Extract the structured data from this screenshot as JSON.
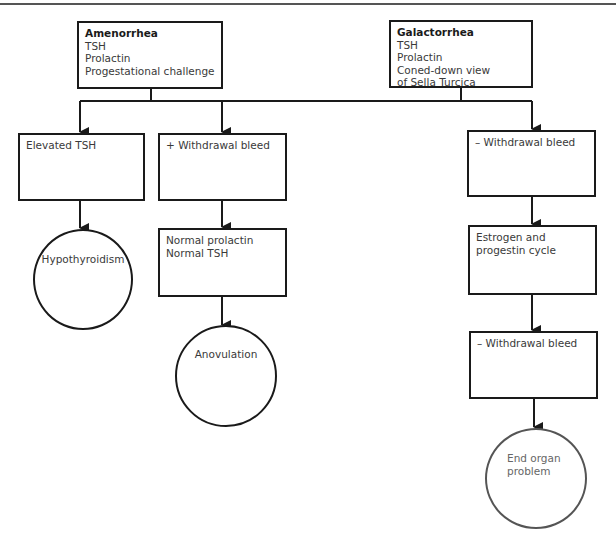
{
  "diagram": {
    "type": "flowchart",
    "colors": {
      "stroke": "#1a1a1a",
      "text": "#3a3a3a",
      "muted_stroke": "#555555"
    },
    "roots": [
      {
        "id": "amenorrhea",
        "title": "Amenorrhea",
        "lines": [
          "TSH",
          "Prolactin",
          "Progestational challenge"
        ]
      },
      {
        "id": "galactorrhea",
        "title": "Galactorrhea",
        "lines": [
          "TSH",
          "Prolactin",
          "Coned-down view",
          "of Sella Turcica"
        ]
      }
    ],
    "nodes": {
      "elevated_tsh": {
        "lines": [
          "Elevated TSH"
        ]
      },
      "plus_withdrawal": {
        "lines": [
          "+ Withdrawal bleed"
        ]
      },
      "minus_withdrawal_1": {
        "lines": [
          "– Withdrawal bleed"
        ]
      },
      "normal_labs": {
        "lines": [
          "Normal prolactin",
          "Normal TSH"
        ]
      },
      "estrogen_progestin": {
        "lines": [
          "Estrogen and",
          "progestin cycle"
        ]
      },
      "minus_withdrawal_2": {
        "lines": [
          "– Withdrawal bleed"
        ]
      }
    },
    "outcomes": {
      "hypothyroidism": {
        "lines": [
          "Hypothyroidism"
        ]
      },
      "anovulation": {
        "lines": [
          "Anovulation"
        ]
      },
      "end_organ": {
        "lines": [
          "End organ",
          "problem"
        ]
      }
    },
    "edges": [
      [
        "amenorrhea+galactorrhea",
        "elevated_tsh"
      ],
      [
        "amenorrhea+galactorrhea",
        "plus_withdrawal"
      ],
      [
        "amenorrhea+galactorrhea",
        "minus_withdrawal_1"
      ],
      [
        "elevated_tsh",
        "hypothyroidism"
      ],
      [
        "plus_withdrawal",
        "normal_labs"
      ],
      [
        "normal_labs",
        "anovulation"
      ],
      [
        "minus_withdrawal_1",
        "estrogen_progestin"
      ],
      [
        "estrogen_progestin",
        "minus_withdrawal_2"
      ],
      [
        "minus_withdrawal_2",
        "end_organ"
      ]
    ]
  }
}
